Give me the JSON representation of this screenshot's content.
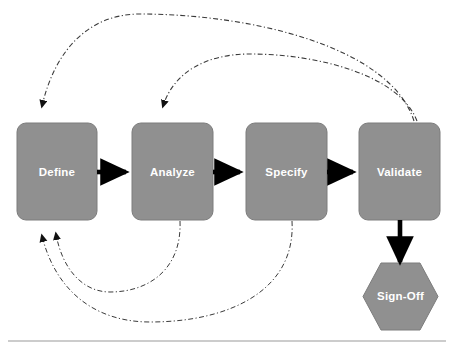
{
  "diagram": {
    "colors": {
      "node_fill": "#909090",
      "node_stroke": "#7c7c7c",
      "label_text": "#ffffff",
      "arrow": "#000000",
      "feedback_line": "#3a3a3a",
      "background": "#ffffff",
      "rule": "#9a9a9a"
    },
    "nodes": [
      {
        "id": "define",
        "label": "Define",
        "shape": "rounded-rect",
        "x": 17,
        "y": 123,
        "w": 80,
        "h": 97
      },
      {
        "id": "analyze",
        "label": "Analyze",
        "shape": "rounded-rect",
        "x": 132,
        "y": 123,
        "w": 81,
        "h": 97
      },
      {
        "id": "specify",
        "label": "Specify",
        "shape": "rounded-rect",
        "x": 246,
        "y": 123,
        "w": 81,
        "h": 97
      },
      {
        "id": "validate",
        "label": "Validate",
        "shape": "rounded-rect",
        "x": 359,
        "y": 123,
        "w": 81,
        "h": 97
      },
      {
        "id": "sign-off",
        "label": "Sign-Off",
        "shape": "hexagon",
        "x": 363,
        "y": 263,
        "w": 75,
        "h": 67
      }
    ],
    "forward_arrows": [
      {
        "id": "define-to-analyze",
        "from": "define",
        "to": "analyze"
      },
      {
        "id": "analyze-to-specify",
        "from": "analyze",
        "to": "specify"
      },
      {
        "id": "specify-to-validate",
        "from": "specify",
        "to": "validate"
      },
      {
        "id": "validate-to-sign-off",
        "from": "validate",
        "to": "sign-off"
      }
    ],
    "feedback_arrows": [
      {
        "id": "validate-to-define",
        "from": "validate",
        "to": "define",
        "style": "dash-dot",
        "route": "over-top"
      },
      {
        "id": "validate-to-analyze",
        "from": "validate",
        "to": "analyze",
        "style": "dash-dot",
        "route": "over-top"
      },
      {
        "id": "analyze-to-define",
        "from": "analyze",
        "to": "define",
        "style": "dash-dot",
        "route": "under-bottom"
      },
      {
        "id": "specify-to-define",
        "from": "specify",
        "to": "define",
        "style": "dash-dot",
        "route": "under-bottom"
      }
    ],
    "footer_rule": {
      "y": 341,
      "x1": 8,
      "x2": 446
    }
  }
}
